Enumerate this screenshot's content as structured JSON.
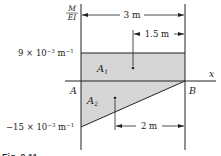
{
  "diagram": {
    "y_axis_label_top": "M",
    "y_axis_label_bottom": "EI",
    "x_axis_label": "x",
    "point_a": "A",
    "point_b": "B",
    "area_1": "A",
    "area_1_sub": "1",
    "area_2": "A",
    "area_2_sub": "2",
    "top_value": "9 × 10",
    "top_value_exp": "−3",
    "top_value_unit": " m",
    "top_value_unit_exp": "−1",
    "bottom_value": "−15 × 10",
    "bottom_value_exp": "−3",
    "bottom_value_unit": " m",
    "bottom_value_unit_exp": "−1",
    "dim_total": "3 m",
    "dim_centroid_1": "1.5 m",
    "dim_centroid_2": "2 m",
    "caption": "Fig. 9.11",
    "colors": {
      "fill": "#d4d4d4",
      "line": "#222222"
    }
  }
}
